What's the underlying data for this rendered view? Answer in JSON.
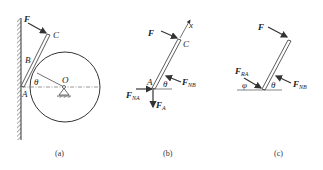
{
  "figure_a": {
    "caption": "(a)",
    "labels": {
      "F": "F",
      "C": "C",
      "B": "B",
      "A": "A",
      "O": "O",
      "theta": "θ"
    }
  },
  "figure_b": {
    "caption": "(b)",
    "labels": {
      "F": "F",
      "C": "C",
      "A": "A",
      "x": "x",
      "theta": "θ",
      "FNA_main": "F",
      "FNA_sub": "NA",
      "FNB_main": "F",
      "FNB_sub": "NB",
      "FA_main": "F",
      "FA_sub": "A"
    }
  },
  "figure_c": {
    "caption": "(c)",
    "labels": {
      "F": "F",
      "theta": "θ",
      "phi": "φ",
      "FRA_main": "F",
      "FRA_sub": "RA",
      "FNB_main": "F",
      "FNB_sub": "NB"
    }
  },
  "colors": {
    "stroke": "#333333",
    "text": "#222222"
  }
}
